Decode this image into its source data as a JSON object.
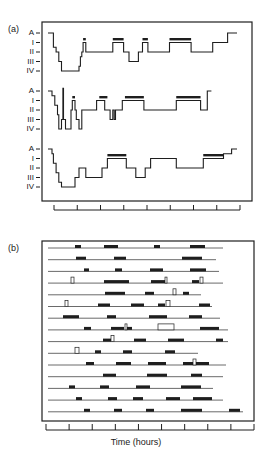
{
  "figure": {
    "panel_a_label": "(a)",
    "panel_b_label": "(b)",
    "x_axis_label": "Time (hours)"
  },
  "chart_data": [
    {
      "type": "line",
      "title": "(a) Hypnograms (sleep stages over time)",
      "xlabel": "",
      "ylabel": "Sleep stage",
      "y_tick_labels": [
        "A",
        "I",
        "II",
        "III",
        "IV"
      ],
      "x_ticks_count": 9,
      "grid": false,
      "note": "Stepped hypnograms; heavy bars above level I mark REM periods",
      "series": [
        {
          "name": "hypnogram 1",
          "points": [
            [
              0,
              0
            ],
            [
              4,
              0
            ],
            [
              4,
              1.5
            ],
            [
              6,
              1.5
            ],
            [
              6,
              2
            ],
            [
              8,
              2
            ],
            [
              8,
              3
            ],
            [
              10,
              3
            ],
            [
              10,
              4
            ],
            [
              23,
              4
            ],
            [
              23,
              3.5
            ],
            [
              24,
              3.5
            ],
            [
              24,
              2.5
            ],
            [
              25,
              2.5
            ],
            [
              25,
              2
            ],
            [
              26,
              2
            ],
            [
              26,
              1
            ],
            [
              28,
              1
            ],
            [
              28,
              2
            ],
            [
              48,
              2
            ],
            [
              48,
              1
            ],
            [
              56,
              1
            ],
            [
              56,
              2
            ],
            [
              60,
              2
            ],
            [
              60,
              3
            ],
            [
              67,
              3
            ],
            [
              67,
              2
            ],
            [
              70,
              2
            ],
            [
              70,
              1
            ],
            [
              74,
              1
            ],
            [
              74,
              2
            ],
            [
              90,
              2
            ],
            [
              90,
              1
            ],
            [
              106,
              1
            ],
            [
              106,
              2
            ],
            [
              122,
              2
            ],
            [
              122,
              1
            ],
            [
              133,
              1
            ],
            [
              133,
              0
            ],
            [
              140,
              0
            ]
          ],
          "rem_bars": [
            [
              26,
              28
            ],
            [
              48,
              56
            ],
            [
              70,
              74
            ],
            [
              90,
              106
            ]
          ]
        },
        {
          "name": "hypnogram 2",
          "points": [
            [
              0,
              0
            ],
            [
              3,
              0
            ],
            [
              3,
              0.5
            ],
            [
              5,
              0.5
            ],
            [
              5,
              1.5
            ],
            [
              7,
              1.5
            ],
            [
              7,
              2.5
            ],
            [
              8,
              2.5
            ],
            [
              8,
              4
            ],
            [
              10,
              4
            ],
            [
              10,
              3
            ],
            [
              11,
              3
            ],
            [
              11,
              -0.3
            ],
            [
              11.5,
              -0.3
            ],
            [
              11.5,
              3
            ],
            [
              13,
              3
            ],
            [
              13,
              4
            ],
            [
              17,
              4
            ],
            [
              17,
              2
            ],
            [
              18,
              2
            ],
            [
              18,
              1
            ],
            [
              20,
              1
            ],
            [
              20,
              2
            ],
            [
              21,
              2
            ],
            [
              21,
              3
            ],
            [
              23,
              3
            ],
            [
              23,
              4
            ],
            [
              25,
              4
            ],
            [
              25,
              2
            ],
            [
              36,
              2
            ],
            [
              36,
              1
            ],
            [
              42,
              1
            ],
            [
              42,
              2
            ],
            [
              46,
              2
            ],
            [
              46,
              3
            ],
            [
              48,
              3
            ],
            [
              48,
              2
            ],
            [
              49,
              2
            ],
            [
              49,
              3
            ],
            [
              50,
              3
            ],
            [
              50,
              2
            ],
            [
              55,
              2
            ],
            [
              55,
              1
            ],
            [
              71,
              1
            ],
            [
              71,
              2
            ],
            [
              95,
              2
            ],
            [
              95,
              1
            ],
            [
              113,
              1
            ],
            [
              113,
              2
            ],
            [
              118,
              2
            ],
            [
              118,
              0
            ],
            [
              121,
              0
            ]
          ],
          "rem_bars": [
            [
              18,
              20
            ],
            [
              38,
              44
            ],
            [
              57,
              71
            ],
            [
              95,
              113
            ]
          ]
        },
        {
          "name": "hypnogram 3",
          "points": [
            [
              0,
              0
            ],
            [
              3,
              0
            ],
            [
              3,
              0.5
            ],
            [
              4,
              0.5
            ],
            [
              4,
              1.5
            ],
            [
              6,
              1.5
            ],
            [
              6,
              2.5
            ],
            [
              8,
              2.5
            ],
            [
              8,
              3.5
            ],
            [
              10,
              3.5
            ],
            [
              10,
              4
            ],
            [
              20,
              4
            ],
            [
              20,
              3
            ],
            [
              23,
              3
            ],
            [
              23,
              2
            ],
            [
              28,
              2
            ],
            [
              28,
              3
            ],
            [
              40,
              3
            ],
            [
              40,
              2
            ],
            [
              44,
              2
            ],
            [
              44,
              1
            ],
            [
              58,
              1
            ],
            [
              58,
              2
            ],
            [
              65,
              2
            ],
            [
              65,
              3
            ],
            [
              72,
              3
            ],
            [
              72,
              2
            ],
            [
              76,
              2
            ],
            [
              76,
              1
            ],
            [
              95,
              1
            ],
            [
              95,
              2
            ],
            [
              115,
              2
            ],
            [
              115,
              1
            ],
            [
              130,
              1
            ],
            [
              130,
              0.5
            ],
            [
              136,
              0.5
            ],
            [
              136,
              0
            ],
            [
              140,
              0
            ]
          ],
          "rem_bars": [
            [
              44,
              58
            ],
            [
              115,
              130
            ]
          ]
        }
      ]
    },
    {
      "type": "table",
      "title": "(b) REM episode raster across nights",
      "xlabel": "Time (hours)",
      "x_ticks_count": 10,
      "rows_count": 15,
      "note": "Each row is one night; filled bars = REM episodes; open rectangles = awakenings",
      "rows": [
        {
          "line": [
            0,
            175
          ],
          "bars": [
            [
              27,
              33
            ],
            [
              56,
              70
            ],
            [
              106,
              112
            ],
            [
              142,
              157
            ]
          ],
          "open": []
        },
        {
          "line": [
            0,
            168
          ],
          "bars": [
            [
              28,
              38
            ],
            [
              66,
              78
            ],
            [
              134,
              154
            ]
          ],
          "open": []
        },
        {
          "line": [
            0,
            171
          ],
          "bars": [
            [
              36,
              41
            ],
            [
              67,
              74
            ],
            [
              102,
              115
            ],
            [
              142,
              158
            ]
          ],
          "open": []
        },
        {
          "line": [
            0,
            175
          ],
          "bars": [
            [
              56,
              81
            ],
            [
              103,
              117
            ],
            [
              144,
              151
            ]
          ],
          "open": [
            [
              23,
              26
            ],
            [
              117,
              119
            ],
            [
              152,
              155
            ]
          ]
        },
        {
          "line": [
            0,
            153
          ],
          "bars": [
            [
              57,
              77
            ],
            [
              97,
              106
            ],
            [
              135,
              141
            ]
          ],
          "open": [
            [
              125,
              128
            ]
          ]
        },
        {
          "line": [
            0,
            164
          ],
          "bars": [
            [
              50,
              62
            ],
            [
              83,
              96
            ],
            [
              110,
              117
            ],
            [
              151,
              162
            ]
          ],
          "open": [
            [
              17,
              20
            ],
            [
              118,
              122
            ]
          ]
        },
        {
          "line": [
            0,
            172
          ],
          "bars": [
            [
              15,
              31
            ],
            [
              59,
              68
            ],
            [
              101,
              119
            ],
            [
              141,
              154
            ]
          ],
          "open": []
        },
        {
          "line": [
            0,
            180
          ],
          "bars": [
            [
              36,
              43
            ],
            [
              63,
              76
            ],
            [
              78,
              84
            ],
            [
              152,
              171
            ]
          ],
          "open": [
            [
              77,
              79
            ],
            [
              110,
              126
            ]
          ]
        },
        {
          "line": [
            0,
            180
          ],
          "bars": [
            [
              55,
              63
            ],
            [
              86,
              98
            ],
            [
              120,
              136
            ],
            [
              168,
              175
            ]
          ],
          "open": [
            [
              63,
              66
            ]
          ]
        },
        {
          "line": [
            0,
            150
          ],
          "bars": [
            [
              47,
              53
            ],
            [
              75,
              84
            ],
            [
              117,
              127
            ]
          ],
          "open": [
            [
              27,
              31
            ]
          ]
        },
        {
          "line": [
            0,
            178
          ],
          "bars": [
            [
              38,
              46
            ],
            [
              68,
              83
            ],
            [
              100,
              118
            ],
            [
              135,
              145
            ],
            [
              148,
              161
            ]
          ],
          "open": [
            [
              145,
              148
            ]
          ]
        },
        {
          "line": [
            0,
            175
          ],
          "bars": [
            [
              55,
              68
            ],
            [
              99,
              119
            ],
            [
              143,
              154
            ]
          ],
          "open": []
        },
        {
          "line": [
            0,
            165
          ],
          "bars": [
            [
              21,
              27
            ],
            [
              52,
              61
            ],
            [
              88,
              102
            ],
            [
              133,
              153
            ]
          ],
          "open": []
        },
        {
          "line": [
            0,
            175
          ],
          "bars": [
            [
              28,
              34
            ],
            [
              60,
              69
            ],
            [
              85,
              95
            ],
            [
              118,
              132
            ],
            [
              145,
              164
            ]
          ],
          "open": []
        },
        {
          "line": [
            0,
            195
          ],
          "bars": [
            [
              36,
              42
            ],
            [
              66,
              74
            ],
            [
              98,
              106
            ],
            [
              133,
              154
            ],
            [
              181,
              192
            ]
          ],
          "open": []
        }
      ]
    }
  ]
}
